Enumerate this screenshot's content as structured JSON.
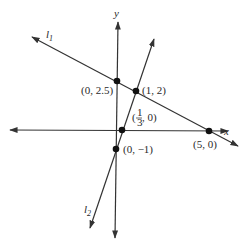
{
  "diagram": {
    "axes": {
      "x_label": "x",
      "y_label": "y"
    },
    "lines": [
      {
        "name": "l",
        "subscript": "1"
      },
      {
        "name": "l",
        "subscript": "2"
      }
    ],
    "points": [
      {
        "label": "(0, 2.5)"
      },
      {
        "label": "(1, 2)"
      },
      {
        "label_pre": "(",
        "frac_num": "1",
        "frac_den": "3",
        "label_post": ", 0)"
      },
      {
        "label": "(0, −1)"
      },
      {
        "label": "(5, 0)"
      }
    ],
    "colors": {
      "ink": "#333333",
      "background": "#ffffff"
    }
  }
}
